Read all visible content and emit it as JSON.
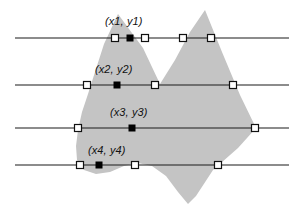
{
  "figure": {
    "width": 304,
    "height": 214,
    "background_color": "#ffffff",
    "polygon_fill_color": "#c4c4c4",
    "line_color": "#1a1a1a",
    "marker_open_fill": "#ffffff",
    "marker_open_stroke": "#111111",
    "marker_filled_color": "#000000"
  },
  "chart_data": {
    "type": "scatter",
    "title": "",
    "xlabel": "",
    "ylabel": "",
    "xlim": [
      0,
      304
    ],
    "ylim": [
      214,
      0
    ],
    "grid": false,
    "legend": "none",
    "polygon": {
      "name": "filled-region",
      "fill": "#c4c4c4",
      "vertices": [
        [
          118,
          14
        ],
        [
          143,
          48
        ],
        [
          160,
          84
        ],
        [
          175,
          60
        ],
        [
          190,
          32
        ],
        [
          205,
          10
        ],
        [
          222,
          52
        ],
        [
          240,
          95
        ],
        [
          256,
          128
        ],
        [
          238,
          148
        ],
        [
          213,
          170
        ],
        [
          196,
          196
        ],
        [
          188,
          204
        ],
        [
          178,
          192
        ],
        [
          166,
          176
        ],
        [
          152,
          166
        ],
        [
          138,
          163
        ],
        [
          124,
          166
        ],
        [
          110,
          172
        ],
        [
          96,
          174
        ],
        [
          84,
          170
        ],
        [
          77,
          160
        ],
        [
          76,
          146
        ],
        [
          78,
          130
        ],
        [
          82,
          112
        ],
        [
          88,
          94
        ],
        [
          95,
          72
        ],
        [
          104,
          44
        ]
      ]
    },
    "scanlines": [
      {
        "name": "scanline-1",
        "y": 38,
        "x_start": 15,
        "x_end": 289,
        "label": "(x1, y1)",
        "label_x": 105,
        "label_y": 16,
        "markers": [
          {
            "x": 115,
            "type": "open"
          },
          {
            "x": 130,
            "type": "filled"
          },
          {
            "x": 145,
            "type": "open"
          },
          {
            "x": 183,
            "type": "open"
          },
          {
            "x": 211,
            "type": "open"
          }
        ]
      },
      {
        "name": "scanline-2",
        "y": 85,
        "x_start": 15,
        "x_end": 289,
        "label": "(x2, y2)",
        "label_x": 95,
        "label_y": 64,
        "markers": [
          {
            "x": 87,
            "type": "open"
          },
          {
            "x": 117,
            "type": "filled"
          },
          {
            "x": 155,
            "type": "open"
          },
          {
            "x": 233,
            "type": "open"
          }
        ]
      },
      {
        "name": "scanline-3",
        "y": 128,
        "x_start": 15,
        "x_end": 289,
        "label": "(x3, y3)",
        "label_x": 110,
        "label_y": 107,
        "markers": [
          {
            "x": 78,
            "type": "open"
          },
          {
            "x": 132,
            "type": "filled"
          },
          {
            "x": 255,
            "type": "open"
          }
        ]
      },
      {
        "name": "scanline-4",
        "y": 165,
        "x_start": 15,
        "x_end": 289,
        "label": "(x4, y4)",
        "label_x": 88,
        "label_y": 145,
        "markers": [
          {
            "x": 80,
            "type": "open"
          },
          {
            "x": 99,
            "type": "filled"
          },
          {
            "x": 135,
            "type": "open"
          },
          {
            "x": 218,
            "type": "open"
          }
        ]
      }
    ]
  }
}
